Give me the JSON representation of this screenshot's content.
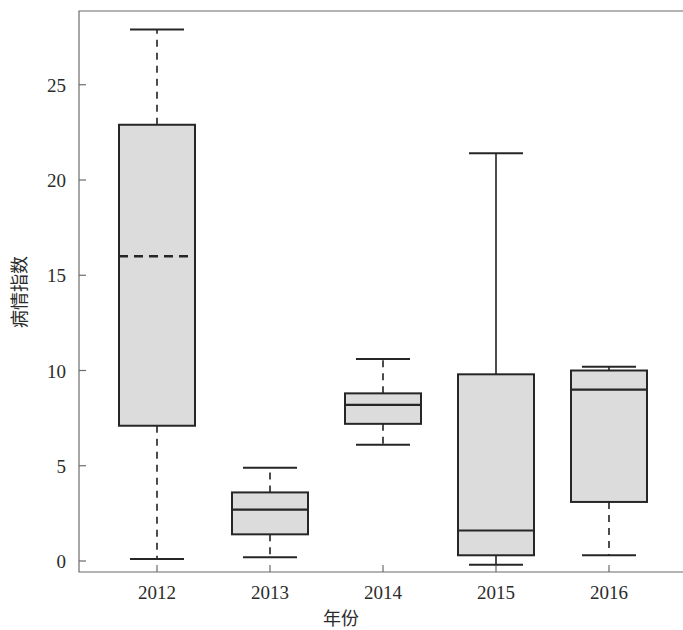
{
  "chart_data": {
    "type": "box",
    "title": "",
    "xlabel": "年份",
    "ylabel": "病情指数",
    "categories": [
      "2012",
      "2013",
      "2014",
      "2015",
      "2016"
    ],
    "ylim": [
      -1.2,
      29.4
    ],
    "yticks": [
      0,
      5,
      10,
      15,
      20,
      25
    ],
    "ytick_labels": [
      "0",
      "5",
      "10",
      "15",
      "20",
      "25"
    ],
    "grid": false,
    "legend": "none",
    "box_fill_color": "#dcdcdc",
    "box_edge_color": "#262626",
    "whisker_color": "#3a3a3a",
    "axis_color": "#6b6b6b",
    "boxes": [
      {
        "category": "2012",
        "whisker_low": 0.1,
        "q1": 7.1,
        "median": 16.0,
        "q3": 22.9,
        "whisker_high": 27.9,
        "whisker_style": "dashed",
        "median_style": "dashed"
      },
      {
        "category": "2013",
        "whisker_low": 0.2,
        "q1": 1.4,
        "median": 2.7,
        "q3": 3.6,
        "whisker_high": 4.9,
        "whisker_style": "dashed",
        "median_style": "solid"
      },
      {
        "category": "2014",
        "whisker_low": 6.1,
        "q1": 7.2,
        "median": 8.2,
        "q3": 8.8,
        "whisker_high": 10.6,
        "whisker_style": "dashed",
        "median_style": "solid"
      },
      {
        "category": "2015",
        "whisker_low": -0.2,
        "q1": 0.3,
        "median": 1.6,
        "q3": 9.8,
        "whisker_high": 21.4,
        "whisker_style": "solid",
        "median_style": "solid"
      },
      {
        "category": "2016",
        "whisker_low": 0.3,
        "q1": 3.1,
        "median": 9.0,
        "q3": 10.0,
        "whisker_high": 10.2,
        "whisker_style": "dashed",
        "median_style": "solid"
      }
    ]
  },
  "geometry": {
    "plot_left": 79,
    "plot_top": 11,
    "plot_bottom": 572,
    "plot_right": 683,
    "y_zero_px": 561,
    "px_per_unit": 19.05,
    "box_half_width": 38,
    "cap_half_width": 27,
    "category_x": [
      157,
      270,
      383,
      496,
      609
    ]
  }
}
